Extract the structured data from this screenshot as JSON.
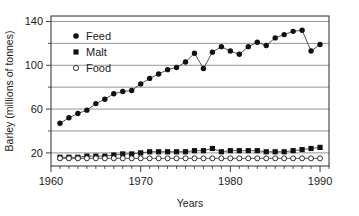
{
  "chart_data": {
    "type": "line",
    "title": "",
    "xlabel": "Years",
    "ylabel": "Barley (millions of tonnes)",
    "xlim": [
      1960,
      1991
    ],
    "ylim": [
      8,
      145
    ],
    "grid": true,
    "grid_values": [
      20,
      40,
      60,
      80,
      100,
      120,
      140
    ],
    "y_ticks_labeled": [
      20,
      60,
      100,
      140
    ],
    "y_tick_labels": [
      "20",
      "60",
      "100",
      "140"
    ],
    "y_ticks_minor": [
      40,
      80,
      120
    ],
    "x_ticks_labeled": [
      1960,
      1970,
      1980,
      1990
    ],
    "x_tick_labels": [
      "1960",
      "1970",
      "1980",
      "1990"
    ],
    "x_ticks_minor_step": 1,
    "legend_position": "upper-left-inside",
    "x": [
      1961,
      1962,
      1963,
      1964,
      1965,
      1966,
      1967,
      1968,
      1969,
      1970,
      1971,
      1972,
      1973,
      1974,
      1975,
      1976,
      1977,
      1978,
      1979,
      1980,
      1981,
      1982,
      1983,
      1984,
      1985,
      1986,
      1987,
      1988,
      1989,
      1990
    ],
    "series": [
      {
        "name": "Feed",
        "marker": "filled-circle",
        "values": [
          47,
          52,
          56,
          59,
          65,
          69,
          74,
          76,
          77,
          83,
          88,
          92,
          96,
          98,
          103,
          111,
          97,
          112,
          117,
          113,
          110,
          117,
          121,
          118,
          125,
          128,
          131,
          132,
          113,
          119
        ]
      },
      {
        "name": "Malt",
        "marker": "filled-square",
        "values": [
          16,
          16,
          16,
          17,
          17,
          17,
          18,
          19,
          19,
          20,
          21,
          21,
          21,
          21,
          21,
          22,
          22,
          24,
          21,
          22,
          22,
          22,
          22,
          21,
          21,
          21,
          22,
          23,
          24,
          25
        ]
      },
      {
        "name": "Food",
        "marker": "open-circle",
        "values": [
          15,
          15,
          15,
          15,
          15,
          15,
          15,
          15,
          15,
          15,
          15,
          15,
          15,
          15,
          15,
          15,
          15,
          15,
          15,
          15,
          15,
          15,
          15,
          15,
          15,
          15,
          15,
          15,
          15,
          15
        ]
      }
    ]
  },
  "legend": {
    "items": [
      {
        "label": "Feed",
        "marker": "filled-circle"
      },
      {
        "label": "Malt",
        "marker": "filled-square"
      },
      {
        "label": "Food",
        "marker": "open-circle"
      }
    ]
  }
}
